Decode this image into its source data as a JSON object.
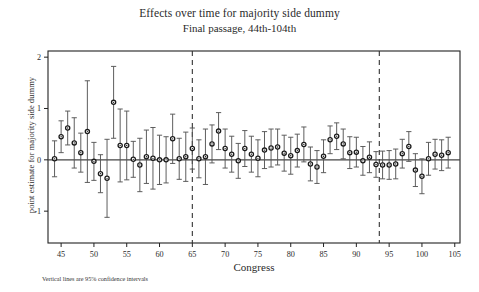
{
  "chart_data": {
    "type": "scatter",
    "title": "Effects over time for majority side dummy",
    "subtitle": "Final passage, 44th-104th",
    "xlabel": "Congress",
    "ylabel": "point estimate for majority side dummy",
    "footnote": "Vertical lines are 95% confidence intervals",
    "grid": false,
    "legend": "none",
    "xlim": [
      43.0,
      105.8
    ],
    "ylim": [
      -1.62,
      2.12
    ],
    "xticks": [
      45,
      50,
      55,
      60,
      65,
      70,
      75,
      80,
      85,
      90,
      95,
      100,
      105
    ],
    "yticks": [
      2,
      1,
      0,
      -1
    ],
    "ytick_labels": [
      "2",
      "1",
      "0",
      "-1"
    ],
    "reference_lines": {
      "horizontal": [
        0
      ],
      "vertical_dashed": [
        65,
        93.5
      ]
    },
    "series": [
      {
        "name": "point estimate for majority side dummy",
        "marker": "circle-dot",
        "error_bars": "95% confidence intervals",
        "x": [
          44,
          45,
          46,
          47,
          48,
          49,
          50,
          51,
          52,
          53,
          54,
          55,
          56,
          57,
          58,
          59,
          60,
          61,
          62,
          63,
          64,
          65,
          66,
          67,
          68,
          69,
          70,
          71,
          72,
          73,
          74,
          75,
          76,
          77,
          78,
          79,
          80,
          81,
          82,
          83,
          84,
          85,
          86,
          87,
          88,
          89,
          90,
          91,
          92,
          93,
          94,
          95,
          96,
          97,
          98,
          99,
          100,
          101,
          102,
          103,
          104
        ],
        "y": [
          0.02,
          0.45,
          0.62,
          0.33,
          0.14,
          0.55,
          -0.03,
          -0.27,
          -0.36,
          1.12,
          0.28,
          0.28,
          0.01,
          -0.1,
          0.06,
          0.03,
          0.0,
          0.0,
          0.41,
          0.02,
          0.06,
          0.22,
          0.02,
          0.06,
          0.31,
          0.56,
          0.22,
          0.11,
          -0.02,
          0.22,
          0.11,
          0.03,
          0.19,
          0.23,
          0.25,
          0.13,
          0.08,
          0.18,
          0.3,
          -0.08,
          -0.14,
          0.07,
          0.39,
          0.46,
          0.31,
          0.14,
          0.15,
          -0.02,
          0.05,
          -0.09,
          -0.1,
          -0.1,
          -0.08,
          0.12,
          0.26,
          -0.2,
          -0.32,
          0.02,
          0.11,
          0.09,
          0.14
        ],
        "ci_low": [
          -0.33,
          0.14,
          0.29,
          -0.16,
          -0.24,
          -0.44,
          -0.4,
          -0.64,
          -1.12,
          0.42,
          -0.43,
          -0.39,
          -0.34,
          -0.62,
          -0.46,
          -0.57,
          -0.48,
          -0.45,
          -0.07,
          -0.38,
          -0.42,
          -0.18,
          -0.35,
          -0.48,
          -0.06,
          0.2,
          -0.16,
          -0.24,
          -0.36,
          -0.13,
          -0.24,
          -0.33,
          -0.17,
          -0.14,
          -0.1,
          -0.22,
          -0.28,
          -0.14,
          -0.04,
          -0.41,
          -0.46,
          -0.25,
          0.12,
          0.2,
          0.02,
          -0.17,
          -0.14,
          -0.3,
          -0.25,
          -0.34,
          -0.37,
          -0.38,
          -0.37,
          -0.16,
          -0.03,
          -0.52,
          -0.66,
          -0.3,
          -0.18,
          -0.21,
          -0.16
        ],
        "ci_high": [
          0.37,
          0.76,
          0.95,
          0.82,
          0.52,
          1.54,
          0.34,
          0.1,
          0.4,
          1.82,
          0.99,
          0.95,
          0.36,
          0.42,
          0.58,
          0.63,
          0.48,
          0.45,
          0.89,
          0.42,
          0.54,
          0.62,
          0.39,
          0.6,
          0.68,
          0.92,
          0.6,
          0.46,
          0.32,
          0.57,
          0.46,
          0.39,
          0.55,
          0.6,
          0.6,
          0.48,
          0.44,
          0.5,
          0.64,
          0.25,
          0.18,
          0.39,
          0.66,
          0.72,
          0.6,
          0.45,
          0.44,
          0.26,
          0.35,
          0.16,
          0.17,
          0.18,
          0.21,
          0.4,
          0.55,
          0.12,
          0.02,
          0.34,
          0.4,
          0.39,
          0.44
        ]
      }
    ]
  },
  "axes": {
    "plot_left_px": 48,
    "plot_right_px": 460,
    "plot_top_px": 51,
    "plot_bottom_px": 243
  }
}
